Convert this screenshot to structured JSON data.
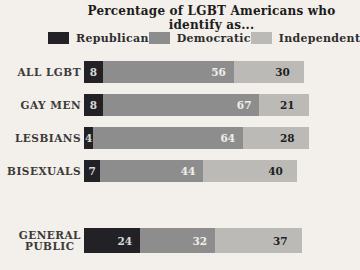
{
  "title": "Percentage of LGBT Americans who identify as...",
  "colors": {
    "background": "#f3efea",
    "republican": "#222226",
    "democratic": "#8d8d8d",
    "independent": "#bbbab6",
    "title_text": "#1c1c1c",
    "category_label_text": "#3b3b3b",
    "value_on_dark": "#d9d9d6",
    "value_on_gray": "#efeeea",
    "value_on_light": "#1f1f1f"
  },
  "chart_data": {
    "type": "bar",
    "orientation": "horizontal",
    "stacked": true,
    "unit": "percent",
    "title": "Percentage of LGBT Americans who identify as...",
    "legend_position": "top",
    "grid": false,
    "axes_shown": false,
    "value_labels_shown": true,
    "categories": [
      "ALL LGBT",
      "GAY MEN",
      "LESBIANS",
      "BISEXUALS",
      "GENERAL PUBLIC"
    ],
    "series": [
      {
        "name": "Republican",
        "color": "#222226",
        "values": [
          8,
          8,
          4,
          7,
          24
        ]
      },
      {
        "name": "Democratic",
        "color": "#8d8d8d",
        "values": [
          56,
          67,
          64,
          44,
          32
        ]
      },
      {
        "name": "Independent",
        "color": "#bbbab6",
        "values": [
          30,
          21,
          28,
          40,
          37
        ]
      }
    ]
  }
}
